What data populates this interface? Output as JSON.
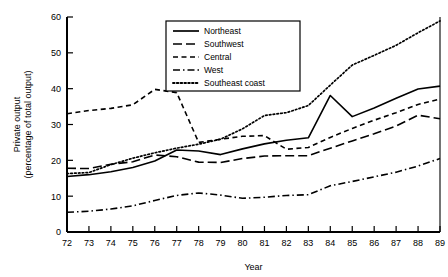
{
  "chart_data": {
    "type": "line",
    "title": "",
    "xlabel": "Year",
    "ylabel": "Private output\n(percentage of total output)",
    "ylabel_line1": "Private output",
    "ylabel_line2": "(percentage of total output)",
    "x": [
      72,
      73,
      74,
      75,
      76,
      77,
      78,
      79,
      80,
      81,
      82,
      83,
      84,
      85,
      86,
      87,
      88,
      89
    ],
    "xtick_labels": [
      "72",
      "73",
      "74",
      "75",
      "76",
      "77",
      "78",
      "79",
      "80",
      "81",
      "82",
      "83",
      "84",
      "85",
      "86",
      "87",
      "88",
      "89"
    ],
    "ytick_labels": [
      "0",
      "10",
      "20",
      "30",
      "40",
      "50",
      "60"
    ],
    "yticks": [
      0,
      10,
      20,
      30,
      40,
      50,
      60
    ],
    "xlim": [
      72,
      89
    ],
    "ylim": [
      0,
      60
    ],
    "grid": false,
    "legend_position": "upper-center",
    "series": [
      {
        "name": "Northeast",
        "style": "solid",
        "color": "#000000",
        "values": [
          15.5,
          16.0,
          16.8,
          18.0,
          19.8,
          22.9,
          22.6,
          21.6,
          23.2,
          24.6,
          25.6,
          26.3,
          38.1,
          32.2,
          34.6,
          37.3,
          39.9,
          40.7
        ]
      },
      {
        "name": "Southwest",
        "style": "long-dash",
        "color": "#000000",
        "values": [
          17.8,
          17.7,
          18.9,
          19.6,
          21.5,
          21.0,
          19.5,
          19.4,
          20.5,
          21.2,
          21.3,
          21.3,
          23.4,
          25.4,
          27.4,
          29.6,
          32.6,
          31.6
        ]
      },
      {
        "name": "Central",
        "style": "dash",
        "color": "#000000",
        "values": [
          33.0,
          33.9,
          34.5,
          35.5,
          39.8,
          38.9,
          25.0,
          25.9,
          26.7,
          26.9,
          23.1,
          23.6,
          26.4,
          28.9,
          31.2,
          33.3,
          35.6,
          37.1
        ]
      },
      {
        "name": "West",
        "style": "dash-dot",
        "color": "#000000",
        "values": [
          5.5,
          5.8,
          6.4,
          7.3,
          8.8,
          10.2,
          10.9,
          10.3,
          9.4,
          9.7,
          10.2,
          10.4,
          12.9,
          14.1,
          15.4,
          16.7,
          18.4,
          20.5
        ]
      },
      {
        "name": "Southeast coast",
        "style": "dot",
        "color": "#000000",
        "values": [
          16.3,
          16.6,
          18.8,
          20.6,
          22.1,
          23.4,
          24.5,
          25.9,
          28.8,
          32.5,
          33.3,
          35.3,
          41.0,
          46.6,
          49.3,
          52.1,
          55.6,
          58.9
        ]
      }
    ]
  },
  "legend": {
    "entries": [
      {
        "label": "Northeast"
      },
      {
        "label": "Southwest"
      },
      {
        "label": "Central"
      },
      {
        "label": "West"
      },
      {
        "label": "Southeast coast"
      }
    ]
  },
  "axes": {
    "x_title": "Year",
    "y_title_line1": "Private output",
    "y_title_line2": "(percentage of total output)"
  }
}
